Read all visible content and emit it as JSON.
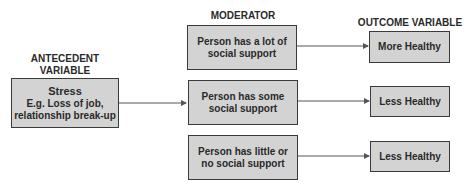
{
  "headings": {
    "antecedent": [
      "ANTECEDENT",
      "VARIABLE"
    ],
    "moderator": "MODERATOR",
    "outcome": "OUTCOME VARIABLE"
  },
  "antecedent": {
    "title": "Stress",
    "lines": [
      "E.g. Loss of job,",
      "relationship break-up"
    ]
  },
  "moderators": [
    {
      "lines": [
        "Person has a lot of",
        "social support"
      ]
    },
    {
      "lines": [
        "Person has some",
        "social support"
      ]
    },
    {
      "lines": [
        "Person has little or",
        "no social support"
      ]
    }
  ],
  "outcomes": [
    {
      "label": "More Healthy"
    },
    {
      "label": "Less Healthy"
    },
    {
      "label": "Less Healthy"
    }
  ],
  "colors": {
    "box_fill": "#d3d3d3",
    "border": "#3a3a3a",
    "text": "#2a2a2a",
    "arrow": "#555555"
  }
}
